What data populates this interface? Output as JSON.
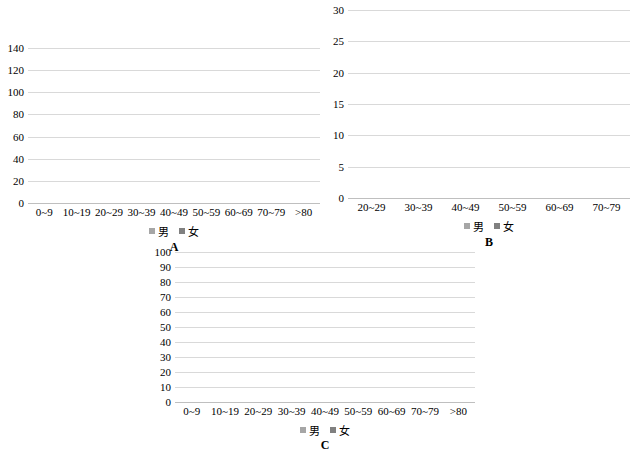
{
  "figure": {
    "background": "#ffffff",
    "male_color": "#a6a6a6",
    "female_color": "#808080",
    "legend": {
      "male_label": "男",
      "female_label": "女"
    }
  },
  "panels": [
    {
      "id": "A",
      "label": "A"
    },
    {
      "id": "B",
      "label": "B"
    },
    {
      "id": "C",
      "label": "C"
    }
  ],
  "chart_data": [
    {
      "type": "bar",
      "title": "A",
      "stacked": true,
      "xlabel": "",
      "ylabel": "",
      "ylim": [
        0,
        140
      ],
      "yticks": [
        0,
        20,
        40,
        60,
        80,
        100,
        120,
        140
      ],
      "grid": true,
      "legend_position": "bottom",
      "categories": [
        "0~9",
        "10~19",
        "20~29",
        "30~39",
        "40~49",
        "50~59",
        "60~69",
        "70~79",
        ">80"
      ],
      "series": [
        {
          "name": "男",
          "color": "#a6a6a6",
          "values": [
            1,
            9,
            27,
            25,
            45,
            48,
            36,
            12,
            0
          ]
        },
        {
          "name": "女",
          "color": "#808080",
          "values": [
            0,
            0,
            3,
            24,
            52,
            68,
            40,
            8,
            3
          ]
        }
      ],
      "totals": [
        1,
        9,
        30,
        49,
        97,
        116,
        76,
        20,
        3
      ]
    },
    {
      "type": "bar",
      "title": "B",
      "stacked": true,
      "xlabel": "",
      "ylabel": "",
      "ylim": [
        0,
        30
      ],
      "yticks": [
        0,
        5,
        10,
        15,
        20,
        25,
        30
      ],
      "grid": true,
      "legend_position": "bottom",
      "categories": [
        "20~29",
        "30~39",
        "40~49",
        "50~59",
        "60~69",
        "70~79"
      ],
      "series": [
        {
          "name": "男",
          "color": "#a6a6a6",
          "values": [
            3,
            2,
            6,
            7,
            7,
            4
          ]
        },
        {
          "name": "女",
          "color": "#808080",
          "values": [
            0,
            3,
            7,
            19,
            11,
            3
          ]
        }
      ],
      "totals": [
        3,
        5,
        13,
        26,
        18,
        7
      ]
    },
    {
      "type": "bar",
      "title": "C",
      "stacked": true,
      "xlabel": "",
      "ylabel": "",
      "ylim": [
        0,
        100
      ],
      "yticks": [
        0,
        10,
        20,
        30,
        40,
        50,
        60,
        70,
        80,
        90,
        100
      ],
      "grid": true,
      "legend_position": "bottom",
      "categories": [
        "0~9",
        "10~19",
        "20~29",
        "30~39",
        "40~49",
        "50~59",
        "60~69",
        "70~79",
        ">80"
      ],
      "series": [
        {
          "name": "男",
          "color": "#a6a6a6",
          "values": [
            1,
            8,
            15,
            23,
            40,
            40,
            29,
            7,
            0
          ]
        },
        {
          "name": "女",
          "color": "#808080",
          "values": [
            0,
            1,
            12,
            21,
            44,
            50,
            29,
            5,
            3
          ]
        }
      ],
      "totals": [
        1,
        9,
        27,
        44,
        84,
        90,
        58,
        12,
        3
      ]
    }
  ]
}
